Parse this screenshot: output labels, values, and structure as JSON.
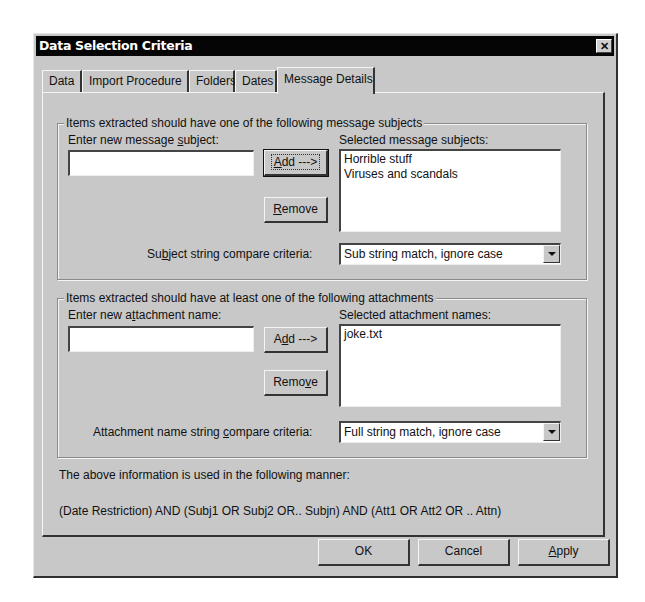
{
  "window": {
    "title": "Data Selection Criteria",
    "close_glyph": "✕"
  },
  "tabs": [
    {
      "label": "Data",
      "active": false
    },
    {
      "label": "Import Procedure",
      "active": false
    },
    {
      "label": "Folders",
      "active": false
    },
    {
      "label": "Dates",
      "active": false
    },
    {
      "label": "Message Details",
      "active": true
    }
  ],
  "subjects": {
    "group_label": "Items extracted should have one of the following message subjects",
    "input_label_pre": "Enter new message ",
    "input_label_mn": "s",
    "input_label_post": "ubject:",
    "input_value": "",
    "add_mn": "A",
    "add_rest": "dd --->",
    "remove_mn": "R",
    "remove_rest": "emove",
    "list_label": "Selected message subjects:",
    "items": [
      "Horrible stuff",
      "Viruses and scandals"
    ],
    "criteria_label_pre": "Su",
    "criteria_label_mn": "b",
    "criteria_label_post": "ject string compare criteria:",
    "criteria_value": "Sub string match, ignore case"
  },
  "attachments": {
    "group_label": "Items extracted should have at least one of the following attachments",
    "input_label_pre": "Enter new a",
    "input_label_mn": "t",
    "input_label_post": "tachment name:",
    "input_value": "",
    "add_pre": "A",
    "add_mn": "d",
    "add_post": "d --->",
    "remove_pre": "Remo",
    "remove_mn": "v",
    "remove_post": "e",
    "list_label": "Selected attachment names:",
    "items": [
      "joke.txt"
    ],
    "criteria_label_pre": "Attachment name string ",
    "criteria_label_mn": "c",
    "criteria_label_post": "ompare criteria:",
    "criteria_value": "Full string match, ignore case"
  },
  "info": {
    "line1": "The above information is used in the following manner:",
    "line2": "(Date Restriction) AND (Subj1 OR Subj2 OR.. Subjn) AND (Att1 OR Att2 OR .. Attn)"
  },
  "footer": {
    "ok": "OK",
    "cancel": "Cancel",
    "apply_mn": "A",
    "apply_rest": "pply"
  }
}
